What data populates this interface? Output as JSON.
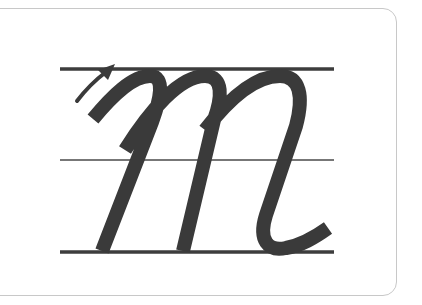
{
  "card": {
    "letter": "m",
    "description": "Cursive lowercase letter m handwriting guide with stroke direction arrow"
  },
  "colors": {
    "stroke": "#3a3a3a",
    "guide_line": "#3d3d3d",
    "card_border": "#c8c8c8",
    "background": "#ffffff"
  },
  "guides": {
    "top_y": 69,
    "middle_y": 160,
    "bottom_y": 251,
    "x_start": 60,
    "x_end": 334
  }
}
